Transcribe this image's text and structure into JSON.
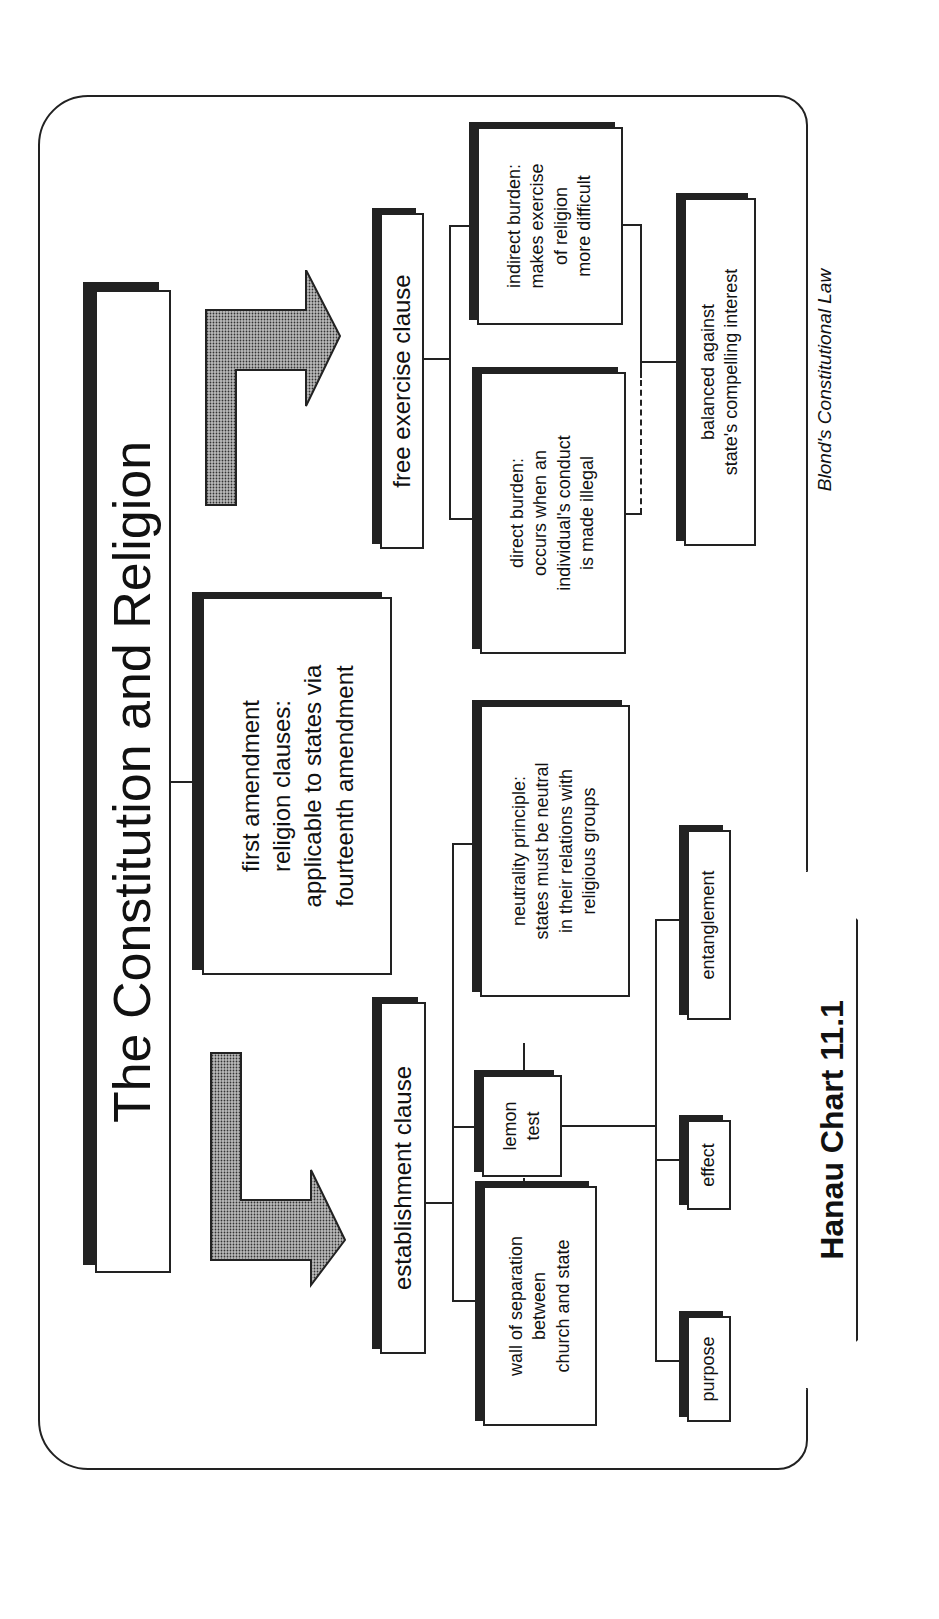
{
  "title": "The Constitution and Religion",
  "root": {
    "lines": [
      "first amendment",
      "religion clauses:",
      "applicable to states via",
      "fourteenth amendment"
    ]
  },
  "establishment": {
    "label": "establishment clause",
    "wall": [
      "wall of separation",
      "between",
      "church and state"
    ],
    "lemon": [
      "lemon",
      "test"
    ],
    "neutrality": [
      "neutrality principle:",
      "states must be neutral",
      "in their relations with",
      "religious groups"
    ],
    "prongs": [
      "purpose",
      "effect",
      "entanglement"
    ]
  },
  "free_exercise": {
    "label": "free exercise clause",
    "direct": [
      "direct burden:",
      "occurs when an",
      "individual's conduct",
      "is made illegal"
    ],
    "indirect": [
      "indirect burden:",
      "makes exercise",
      "of religion",
      "more difficult"
    ],
    "balance": [
      "balanced against",
      "state's compelling interest"
    ]
  },
  "tab_label": "Hanau Chart 11.1",
  "source": "Blond's Constitutional Law",
  "icons": {
    "arrow_left_branch": "l-arrow-icon",
    "arrow_right_branch": "l-arrow-icon"
  },
  "colors": {
    "ink": "#222222",
    "shadow": "#222222",
    "stipple": "#9a9a9a",
    "background": "#ffffff"
  }
}
